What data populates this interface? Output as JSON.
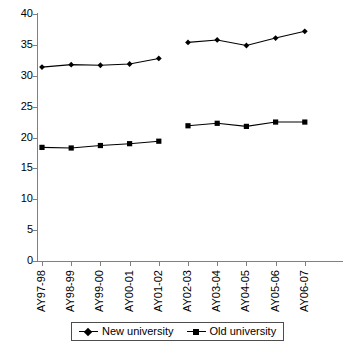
{
  "chart_data": {
    "type": "line",
    "title": "",
    "xlabel": "",
    "ylabel": "",
    "ylim": [
      0,
      40
    ],
    "yticks": [
      0,
      5,
      10,
      15,
      20,
      25,
      30,
      35,
      40
    ],
    "grid": false,
    "legend_position": "bottom",
    "categories": [
      "AY97-98",
      "AY98-99",
      "AY99-00",
      "AY00-01",
      "AY01-02",
      "AY02-03",
      "AY03-04",
      "AY04-05",
      "AY05-06",
      "AY06-07"
    ],
    "series": [
      {
        "name": "New university",
        "marker": "diamond",
        "color": "#000000",
        "values": [
          31.4,
          31.8,
          31.7,
          31.9,
          32.8,
          35.4,
          35.8,
          34.9,
          36.1,
          37.2
        ]
      },
      {
        "name": "Old university",
        "marker": "square",
        "color": "#000000",
        "values": [
          18.4,
          18.3,
          18.7,
          19.0,
          19.4,
          21.9,
          22.3,
          21.8,
          22.5,
          22.5
        ]
      }
    ],
    "break_after_index": 4
  },
  "legend": {
    "entries": [
      {
        "label": "New university",
        "marker": "diamond"
      },
      {
        "label": "Old university",
        "marker": "square"
      }
    ]
  }
}
